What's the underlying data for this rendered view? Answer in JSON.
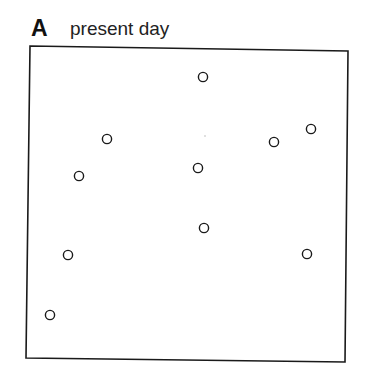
{
  "figure": {
    "panel_label": "A",
    "panel_title": "present day",
    "colors": {
      "stroke": "#1a1a1a",
      "background": "#ffffff"
    }
  },
  "chart_data": {
    "type": "scatter",
    "title": "present day",
    "panel": "A",
    "xlabel": "",
    "ylabel": "",
    "grid": false,
    "legend": null,
    "frame_px": {
      "left": 29,
      "top": 47,
      "right": 347,
      "bottom": 360
    },
    "marker": "open-circle",
    "points_px": [
      {
        "x": 203,
        "y": 77
      },
      {
        "x": 107,
        "y": 139
      },
      {
        "x": 311,
        "y": 129
      },
      {
        "x": 274,
        "y": 142
      },
      {
        "x": 79,
        "y": 176
      },
      {
        "x": 198,
        "y": 168
      },
      {
        "x": 204,
        "y": 228
      },
      {
        "x": 68,
        "y": 255
      },
      {
        "x": 307,
        "y": 254
      },
      {
        "x": 50,
        "y": 315
      }
    ],
    "points_normalized": [
      {
        "x": 0.55,
        "y": 0.9
      },
      {
        "x": 0.25,
        "y": 0.71
      },
      {
        "x": 0.89,
        "y": 0.74
      },
      {
        "x": 0.77,
        "y": 0.7
      },
      {
        "x": 0.16,
        "y": 0.59
      },
      {
        "x": 0.53,
        "y": 0.61
      },
      {
        "x": 0.55,
        "y": 0.42
      },
      {
        "x": 0.12,
        "y": 0.34
      },
      {
        "x": 0.87,
        "y": 0.34
      },
      {
        "x": 0.07,
        "y": 0.14
      }
    ]
  }
}
